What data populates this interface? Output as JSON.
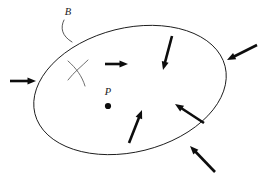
{
  "figure": {
    "canvas": {
      "width": 259,
      "height": 176,
      "background": "#ffffff"
    },
    "colors": {
      "outline": "#1a1a1a",
      "arrow": "#0d0d0d",
      "leader": "#3a3a3a",
      "squiggle": "#4a4a4a",
      "label": "#1a1a1a"
    }
  },
  "labels": {
    "region": "B",
    "point": "P"
  },
  "region": {
    "shape": "ellipse",
    "center_x": 130,
    "center_y": 90,
    "radius_x": 98,
    "radius_y": 62,
    "rotation_deg": -14
  },
  "point": {
    "name": "P",
    "x": 108,
    "y": 106,
    "radius": 3.1,
    "label_x": 108,
    "label_y": 95
  },
  "leader": {
    "label_x": 68,
    "label_y": 15,
    "path": "M 64 20 C 60 28, 62 36, 72 42"
  },
  "squiggle": {
    "stroke_1": "M 68 61 C 76 68, 82 76, 85 86",
    "stroke_2": "M 88 60 C 82 66, 74 72, 68 80"
  },
  "arrows": [
    {
      "name": "arrow-exterior-left",
      "location": "exterior",
      "x1": 10,
      "y1": 81,
      "x2": 36,
      "y2": 81,
      "direction": "right"
    },
    {
      "name": "arrow-interior-upper-left",
      "location": "interior",
      "x1": 105,
      "y1": 64,
      "x2": 128,
      "y2": 64,
      "direction": "right"
    },
    {
      "name": "arrow-interior-upper-right",
      "location": "interior",
      "x1": 172,
      "y1": 36,
      "x2": 163,
      "y2": 70,
      "direction": "down-left"
    },
    {
      "name": "arrow-exterior-right",
      "location": "exterior",
      "x1": 257,
      "y1": 45,
      "x2": 227,
      "y2": 60,
      "direction": "left-down"
    },
    {
      "name": "arrow-interior-lower-left",
      "location": "interior",
      "x1": 129,
      "y1": 143,
      "x2": 142,
      "y2": 110,
      "direction": "up-right"
    },
    {
      "name": "arrow-interior-lower-right",
      "location": "interior",
      "x1": 204,
      "y1": 123,
      "x2": 175,
      "y2": 104,
      "direction": "up-left"
    },
    {
      "name": "arrow-exterior-bottom",
      "location": "exterior",
      "x1": 215,
      "y1": 172,
      "x2": 190,
      "y2": 146,
      "direction": "up-left"
    }
  ]
}
